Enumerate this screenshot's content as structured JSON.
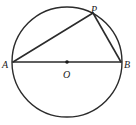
{
  "figure": {
    "background_color": "#ffffff",
    "stroke_color": "#2b2b2b",
    "label_color": "#1a1a1a"
  },
  "labels": {
    "a": "A",
    "b": "B",
    "p": "P",
    "o": "O"
  },
  "chart_data": {
    "type": "diagram",
    "shapes": [
      {
        "name": "circle",
        "kind": "circle",
        "center": [
          67,
          62
        ],
        "radius": 55,
        "fill": "none",
        "stroke": "#2b2b2b",
        "stroke_width": 1.4
      },
      {
        "name": "diameter-AB",
        "kind": "segment",
        "from": [
          13,
          62
        ],
        "to": [
          121,
          62
        ],
        "stroke": "#2b2b2b",
        "stroke_width": 1.6
      },
      {
        "name": "chord-AP",
        "kind": "segment",
        "from": [
          13,
          62
        ],
        "to": [
          93,
          13
        ],
        "stroke": "#2b2b2b",
        "stroke_width": 1.6
      },
      {
        "name": "chord-PB",
        "kind": "segment",
        "from": [
          93,
          13
        ],
        "to": [
          121,
          62
        ],
        "stroke": "#2b2b2b",
        "stroke_width": 1.6
      },
      {
        "name": "center-dot",
        "kind": "point",
        "at": [
          67,
          62
        ],
        "radius": 1.8,
        "fill": "#1a1a1a"
      }
    ],
    "points": [
      {
        "label": "A",
        "at": [
          13,
          62
        ],
        "label_at": [
          2,
          60
        ],
        "on": "circle"
      },
      {
        "label": "B",
        "at": [
          121,
          62
        ],
        "label_at": [
          124,
          60
        ],
        "on": "circle"
      },
      {
        "label": "P",
        "at": [
          93,
          13
        ],
        "label_at": [
          91,
          5
        ],
        "on": "circle"
      },
      {
        "label": "O",
        "at": [
          67,
          62
        ],
        "label_at": [
          63,
          70
        ],
        "on": "center"
      }
    ],
    "annotations": []
  }
}
